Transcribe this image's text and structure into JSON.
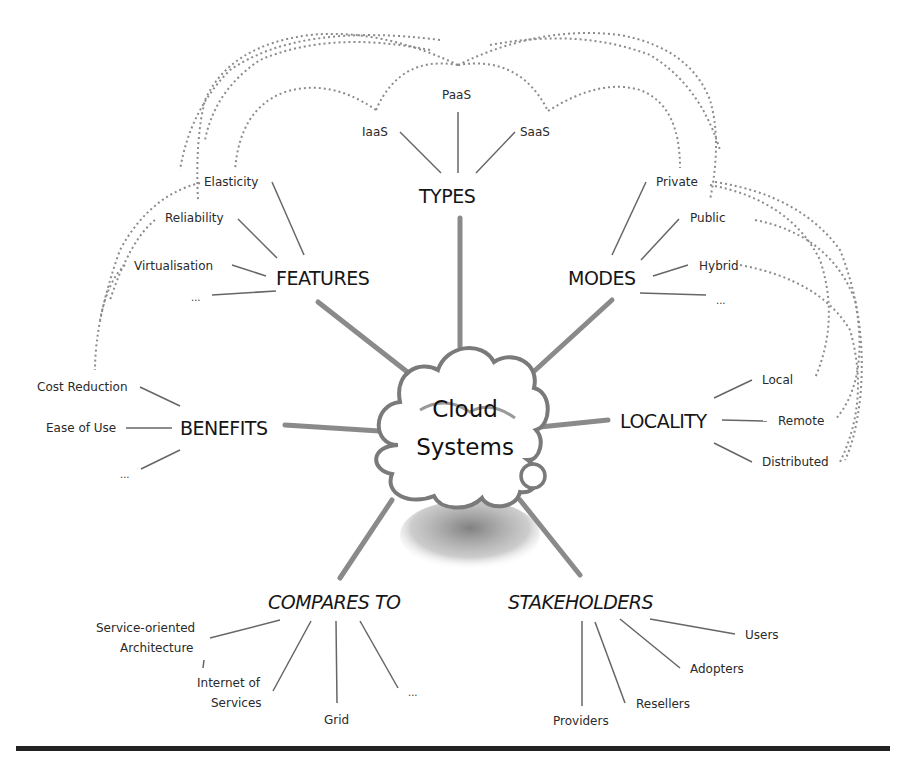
{
  "diagram": {
    "center": {
      "line1": "Cloud",
      "line2": "Systems"
    },
    "categories": {
      "types": {
        "label": "TYPES",
        "items": [
          "IaaS",
          "PaaS",
          "SaaS"
        ]
      },
      "features": {
        "label": "FEATURES",
        "items": [
          "Elasticity",
          "Reliability",
          "Virtualisation",
          "..."
        ]
      },
      "modes": {
        "label": "MODES",
        "items": [
          "Private",
          "Public",
          "Hybrid",
          "..."
        ]
      },
      "benefits": {
        "label": "BENEFITS",
        "items": [
          "Cost Reduction",
          "Ease of Use",
          "..."
        ]
      },
      "locality": {
        "label": "LOCALITY",
        "items": [
          "Local",
          "Remote",
          "Distributed"
        ]
      },
      "compares_to": {
        "label": "COMPARES TO",
        "items": [
          "Service-oriented",
          "Architecture",
          "Internet of",
          "Services",
          "Grid",
          "..."
        ]
      },
      "stakeholders": {
        "label": "STAKEHOLDERS",
        "items": [
          "Users",
          "Adopters",
          "Resellers",
          "Providers"
        ]
      }
    },
    "colors": {
      "spoke": "#8a8a8a",
      "branch": "#666666",
      "dashed": "#8c8c8c",
      "cloud_outline": "#7a7a7a",
      "rule": "#222222"
    }
  }
}
